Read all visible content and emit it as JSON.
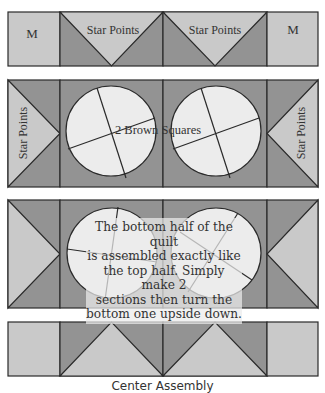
{
  "colors": {
    "light": "#c9c9c9",
    "dark": "#939393",
    "circle": "#ececec",
    "line": "#2a2a2a"
  },
  "rows": [
    {
      "id": "row-1",
      "labels": {
        "left": "M",
        "mid_left": "Star Points",
        "mid_right": "Star Points",
        "right": "M"
      }
    },
    {
      "id": "row-2",
      "labels": {
        "left": "Star Points",
        "center": "2 Brown Squares",
        "right": "Star Points"
      }
    },
    {
      "id": "row-3",
      "note": "The bottom half of the quilt is assembled exactly like the top half. Simply make 2 sections then turn the bottom one upside down."
    },
    {
      "id": "row-4",
      "labels": {}
    }
  ],
  "note_lines": [
    "The bottom half of the quilt",
    "is assembled exactly like",
    "the top half. Simply make 2",
    "sections then turn the",
    "bottom one upside down."
  ],
  "caption": "Center Assembly"
}
